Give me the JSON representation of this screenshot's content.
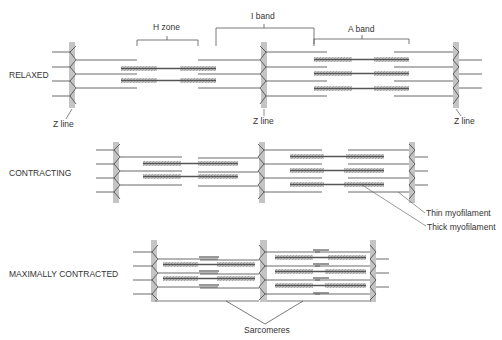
{
  "colors": {
    "line": "#444444",
    "thick_core": "#555555",
    "thick_halo": "#c4c4c4",
    "zband": "#bdbdbd",
    "text": "#333333",
    "background": "#ffffff"
  },
  "labels": {
    "h_zone": "H zone",
    "i_band": "I band",
    "a_band": "A band",
    "z_line_1": "Z line",
    "z_line_2": "Z line",
    "z_line_3": "Z line",
    "thin_myofilament": "Thin myofilament",
    "thick_myofilament": "Thick myofilament",
    "sarcomeres": "Sarcomeres"
  },
  "states": [
    {
      "id": "relaxed",
      "label": "RELAXED",
      "z_lines_x": [
        72,
        264,
        456
      ],
      "y_top": 42,
      "y_bottom": 108
    },
    {
      "id": "contracting",
      "label": "CONTRACTING",
      "z_lines_x": [
        116,
        262,
        412
      ],
      "y_top": 142,
      "y_bottom": 203
    },
    {
      "id": "maximally-contracted",
      "label": "MAXIMALLY CONTRACTED",
      "z_lines_x": [
        153,
        263,
        373
      ],
      "y_top": 242,
      "y_bottom": 302
    }
  ]
}
